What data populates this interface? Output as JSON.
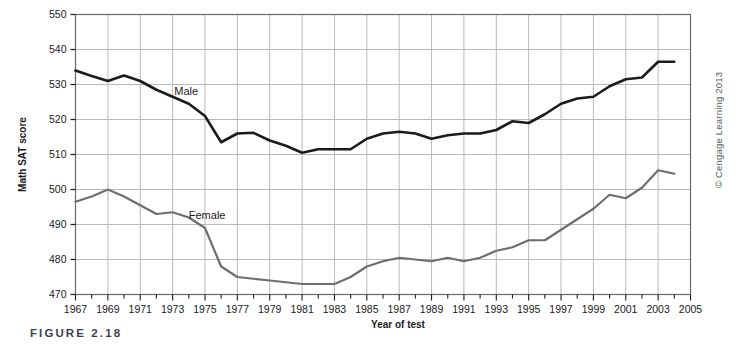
{
  "figure": {
    "caption": "FIGURE 2.18",
    "copyright": "© Cengage Learning 2013"
  },
  "chart_data": {
    "type": "line",
    "title": "",
    "xlabel": "Year of test",
    "ylabel": "Math SAT score",
    "xlim": [
      1967,
      2005
    ],
    "ylim": [
      470,
      550
    ],
    "ytick_step": 10,
    "xtick_step": 1,
    "grid": true,
    "grid_color": "#b9b9b9",
    "x_tick_labels": [
      "1967",
      "1969",
      "1971",
      "1973",
      "1975",
      "1977",
      "1979",
      "1981",
      "1983",
      "1985",
      "1987",
      "1989",
      "1991",
      "1993",
      "1995",
      "1997",
      "1999",
      "2001",
      "2003",
      "2005"
    ],
    "y_tick_labels": [
      "470",
      "480",
      "490",
      "500",
      "510",
      "520",
      "530",
      "540",
      "550"
    ],
    "legend_position": "inline-annotation",
    "x": [
      1967,
      1968,
      1969,
      1970,
      1971,
      1972,
      1973,
      1974,
      1975,
      1976,
      1977,
      1978,
      1979,
      1980,
      1981,
      1982,
      1983,
      1984,
      1985,
      1986,
      1987,
      1988,
      1989,
      1990,
      1991,
      1992,
      1993,
      1994,
      1995,
      1996,
      1997,
      1998,
      1999,
      2000,
      2001,
      2002,
      2003,
      2004
    ],
    "series": [
      {
        "name": "Male",
        "color": "#1b1b1b",
        "label_x": 1973.1,
        "label_y": 527.0,
        "values": [
          534.0,
          532.4,
          531.0,
          532.6,
          531.0,
          528.5,
          526.5,
          524.5,
          521.0,
          513.5,
          516.0,
          516.2,
          514.0,
          512.5,
          510.5,
          511.5,
          511.5,
          511.5,
          514.5,
          516.0,
          516.5,
          516.0,
          514.5,
          515.5,
          516.0,
          516.0,
          517.0,
          519.5,
          519.0,
          521.5,
          524.5,
          526.0,
          526.5,
          529.5,
          531.5,
          532.0,
          536.5,
          536.5
        ]
      },
      {
        "name": "Female",
        "color": "#6e6e6e",
        "label_x": 1974.0,
        "label_y": 491.5,
        "values": [
          496.5,
          498.0,
          500.0,
          498.0,
          495.5,
          493.0,
          493.5,
          492.0,
          489.0,
          478.0,
          475.0,
          474.5,
          474.0,
          473.5,
          473.0,
          473.0,
          473.0,
          475.0,
          478.0,
          479.5,
          480.5,
          480.0,
          479.5,
          480.5,
          479.5,
          480.5,
          482.5,
          483.5,
          485.5,
          485.5,
          488.5,
          491.5,
          494.5,
          498.5,
          497.5,
          500.5,
          505.5,
          504.5
        ]
      }
    ]
  }
}
